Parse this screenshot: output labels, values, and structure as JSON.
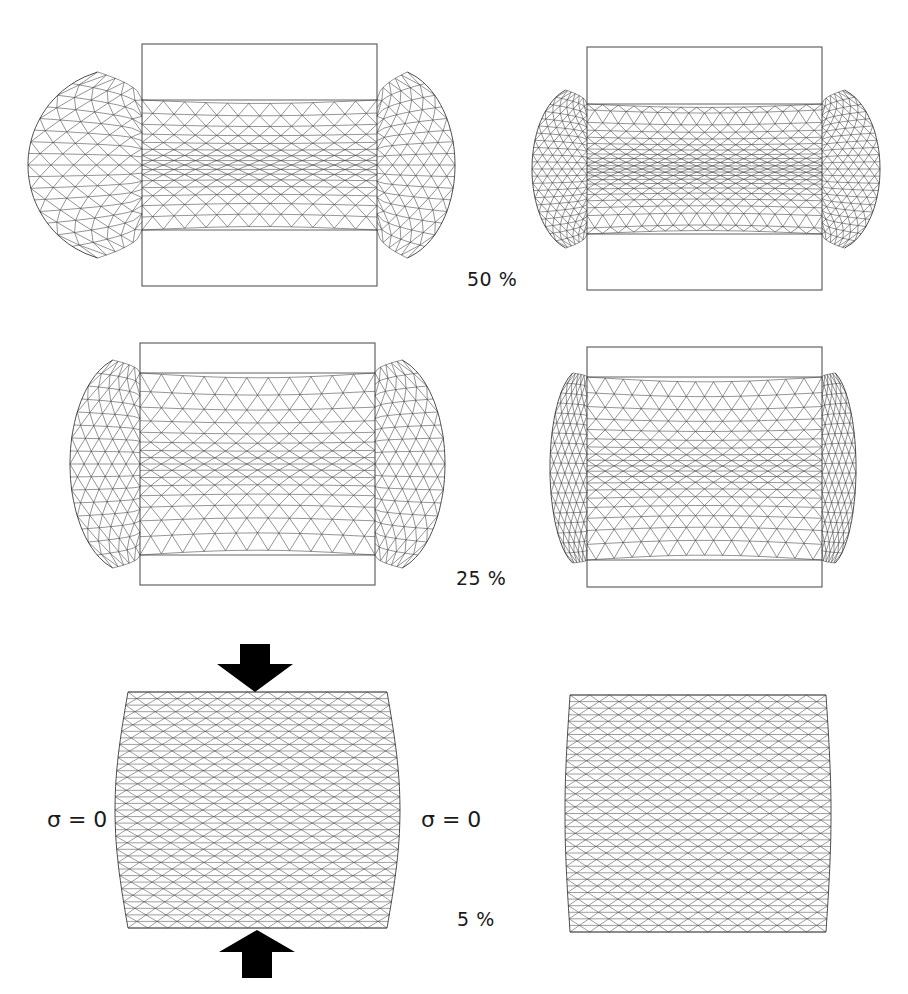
{
  "figure": {
    "colors": {
      "mesh": "#3a3a3a",
      "frame": "#555555",
      "arrow": "#000000",
      "background": "#ffffff"
    },
    "rows": [
      {
        "strain_label": "50 %",
        "panels": [
          {
            "id": "tl",
            "frame": [
              142,
              44,
              377,
              286
            ],
            "band": [
              142,
              100,
              377,
              230
            ],
            "bulb_left_x": 28,
            "bulb_right_x": 455,
            "bulb_top": 72,
            "bulb_bottom": 258,
            "neck": "wide",
            "density": 1.0
          },
          {
            "id": "tr",
            "frame": [
              587,
              47,
              822,
              290
            ],
            "band": [
              587,
              104,
              822,
              234
            ],
            "bulb_left_x": 532,
            "bulb_right_x": 880,
            "bulb_top": 90,
            "bulb_bottom": 248,
            "neck": "narrow",
            "density": 1.35
          }
        ]
      },
      {
        "strain_label": "25 %",
        "panels": [
          {
            "id": "ml",
            "frame": [
              140,
              343,
              375,
              585
            ],
            "band": [
              140,
              373,
              375,
              555
            ],
            "bulb_left_x": 70,
            "bulb_right_x": 445,
            "bulb_top": 360,
            "bulb_bottom": 568,
            "neck": "wide",
            "density": 1.0
          },
          {
            "id": "mr",
            "frame": [
              587,
              347,
              822,
              587
            ],
            "band": [
              587,
              377,
              822,
              560
            ],
            "bulb_left_x": 550,
            "bulb_right_x": 856,
            "bulb_top": 373,
            "bulb_bottom": 563,
            "neck": "narrow",
            "density": 1.2
          }
        ]
      },
      {
        "strain_label": "5 %",
        "panels": [
          {
            "id": "bl",
            "frame": null,
            "band": [
              128,
              692,
              387,
              928
            ],
            "bulge": 13,
            "density": 1.0
          },
          {
            "id": "br",
            "frame": null,
            "band": [
              570,
              695,
              826,
              932
            ],
            "bulge": 5,
            "density": 1.0
          }
        ]
      }
    ],
    "labels": {
      "row1_strain": "50 %",
      "row2_strain": "25 %",
      "row3_strain": "5 %",
      "sigma_left": "σ = 0",
      "sigma_right": "σ = 0"
    },
    "arrows": {
      "top": {
        "x": 255,
        "y_tail": 644,
        "y_tip": 692,
        "direction": "down"
      },
      "bottom": {
        "x": 257,
        "y_tail": 978,
        "y_tip": 930,
        "direction": "up"
      }
    }
  }
}
